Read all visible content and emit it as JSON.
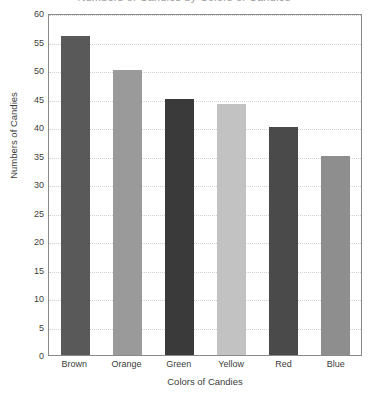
{
  "chart_data": {
    "type": "bar",
    "title": "",
    "title_fragment": "Numbers of Candies by Colors of Candies",
    "categories": [
      "Brown",
      "Orange",
      "Green",
      "Yellow",
      "Red",
      "Blue"
    ],
    "values": [
      56,
      50,
      45,
      44,
      40,
      35
    ],
    "bar_colors": [
      "#595959",
      "#9a9a9a",
      "#3a3a3a",
      "#c2c2c2",
      "#4a4a4a",
      "#8e8e8e"
    ],
    "xlabel": "Colors of Candies",
    "ylabel": "Numbers of Candies",
    "ylim": [
      0,
      60
    ],
    "ytick_step": 5,
    "yticks": [
      0,
      5,
      10,
      15,
      20,
      25,
      30,
      35,
      40,
      45,
      50,
      55,
      60
    ],
    "grid": true,
    "grid_axis": "y",
    "legend": false,
    "frame_color": "#8a8a8a",
    "grid_color": "#d4d4d4",
    "text_color": "#3d3d3d",
    "background": "#ffffff"
  }
}
